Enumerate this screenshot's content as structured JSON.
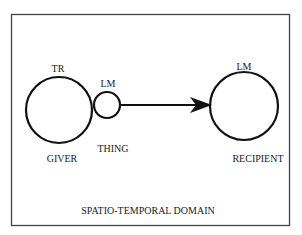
{
  "diagram": {
    "frame_label": "SPATIO-TEMPORAL DOMAIN",
    "giver": {
      "top_label": "TR",
      "bottom_label": "GIVER"
    },
    "thing": {
      "top_label": "LM",
      "bottom_label": "THING"
    },
    "recipient": {
      "top_label": "LM",
      "bottom_label": "RECIPIENT"
    },
    "arrow": {
      "from": "thing",
      "to": "recipient"
    },
    "colors": {
      "stroke": "#111111",
      "frame": "#444444",
      "text": "#222222"
    }
  }
}
